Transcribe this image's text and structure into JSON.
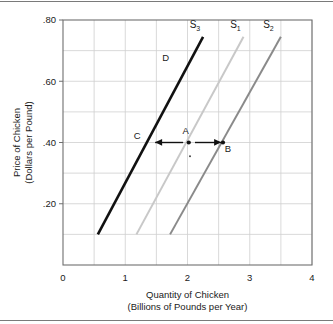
{
  "figure": {
    "name": "supply-curve-shift-chart",
    "background": "#ffffff",
    "border_color": "#7a7a7a"
  },
  "chart_data": {
    "type": "line",
    "title": "",
    "xlabel": "Quantity of Chicken",
    "xlabel_sub": "(Billions of Pounds per Year)",
    "ylabel": "Price of Chicken",
    "ylabel_sub": "(Dollars per Pound)",
    "xlim": [
      0,
      4
    ],
    "ylim": [
      0,
      0.8
    ],
    "x_ticks": [
      "0",
      "1",
      "2",
      "3",
      "4"
    ],
    "x_tick_values": [
      0,
      1,
      2,
      3,
      4
    ],
    "x_minor_step": 0.5,
    "y_ticks": [
      ".20",
      ".40",
      ".60",
      ".80"
    ],
    "y_tick_values": [
      0.2,
      0.4,
      0.6,
      0.8
    ],
    "y_minor_step": 0.1,
    "grid": true,
    "legend": "none",
    "series": [
      {
        "name": "S3",
        "label": "S",
        "subscript": "3",
        "color": "#111111",
        "width": 2.6,
        "points": [
          [
            0.56,
            0.1
          ],
          [
            2.25,
            0.745
          ]
        ],
        "label_x": 2.12,
        "label_y": 0.775
      },
      {
        "name": "S1",
        "label": "S",
        "subscript": "1",
        "color": "#c8c8c8",
        "width": 2.0,
        "points": [
          [
            1.18,
            0.1
          ],
          [
            2.9,
            0.745
          ]
        ],
        "label_x": 2.77,
        "label_y": 0.775
      },
      {
        "name": "S2",
        "label": "S",
        "subscript": "2",
        "color": "#8a8a8a",
        "width": 2.0,
        "points": [
          [
            1.72,
            0.1
          ],
          [
            3.5,
            0.745
          ]
        ],
        "label_x": 3.3,
        "label_y": 0.775
      }
    ],
    "annotations": {
      "points": [
        {
          "name": "point-c",
          "label": "C",
          "x": 1.4,
          "y": 0.4,
          "dot": false,
          "label_dx": -13,
          "label_dy": -4
        },
        {
          "name": "point-a",
          "label": "A",
          "x": 2.02,
          "y": 0.4,
          "dot": true,
          "label_dx": -3,
          "label_dy": -9
        },
        {
          "name": "point-b",
          "label": "B",
          "x": 2.57,
          "y": 0.4,
          "dot": true,
          "label_dx": 5,
          "label_dy": 9
        },
        {
          "name": "point-d",
          "label": "D",
          "x": 1.86,
          "y": 0.665,
          "dot": false,
          "label_dx": -13,
          "label_dy": 0
        }
      ],
      "extra_dot": {
        "name": "small-dot-below-a",
        "x": 2.04,
        "y": 0.355
      },
      "arrows": [
        {
          "name": "arrow-left-to-c",
          "from_x": 1.93,
          "to_x": 1.48,
          "y": 0.4,
          "direction": "left"
        },
        {
          "name": "arrow-right-to-b",
          "from_x": 2.12,
          "to_x": 2.54,
          "y": 0.4,
          "direction": "right"
        }
      ],
      "reference_line": {
        "name": "price-reference-line",
        "y": 0.4,
        "x_from": 1.4,
        "x_to": 2.57
      }
    },
    "colors": {
      "grid": "#cfcfcf",
      "axis": "#6f6f6f",
      "text": "#1a1a1a",
      "s3": "#111111",
      "s1": "#c8c8c8",
      "s2": "#8a8a8a"
    }
  }
}
